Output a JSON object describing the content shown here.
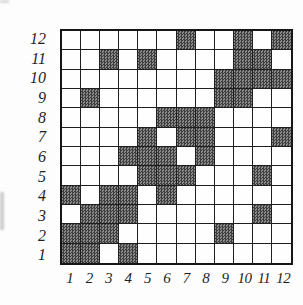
{
  "figure": {
    "kind": "binary matrix grid figure",
    "row_labels_top_to_bottom": [
      "12",
      "11",
      "10",
      "9",
      "8",
      "7",
      "6",
      "5",
      "4",
      "3",
      "2",
      "1"
    ],
    "col_labels_left_to_right": [
      "1",
      "2",
      "3",
      "4",
      "5",
      "6",
      "7",
      "8",
      "9",
      "10",
      "11",
      "12"
    ]
  },
  "chart_data": {
    "type": "heatmap",
    "title": "",
    "xlabel": "",
    "ylabel": "",
    "x_tick_labels": [
      "1",
      "2",
      "3",
      "4",
      "5",
      "6",
      "7",
      "8",
      "9",
      "10",
      "11",
      "12"
    ],
    "y_tick_labels_top_to_bottom": [
      "12",
      "11",
      "10",
      "9",
      "8",
      "7",
      "6",
      "5",
      "4",
      "3",
      "2",
      "1"
    ],
    "legend": "none",
    "grid": true,
    "matrix_rows_top_to_bottom": [
      [
        0,
        0,
        0,
        0,
        0,
        0,
        1,
        0,
        0,
        1,
        0,
        1
      ],
      [
        0,
        0,
        1,
        0,
        1,
        0,
        0,
        0,
        0,
        1,
        1,
        0
      ],
      [
        0,
        0,
        0,
        0,
        0,
        0,
        0,
        0,
        1,
        1,
        1,
        1
      ],
      [
        0,
        1,
        0,
        0,
        0,
        0,
        0,
        0,
        1,
        1,
        0,
        0
      ],
      [
        0,
        0,
        0,
        0,
        0,
        1,
        1,
        1,
        0,
        0,
        0,
        0
      ],
      [
        0,
        0,
        0,
        0,
        1,
        0,
        1,
        1,
        0,
        0,
        0,
        1
      ],
      [
        0,
        0,
        0,
        1,
        1,
        1,
        0,
        1,
        0,
        0,
        0,
        0
      ],
      [
        0,
        0,
        0,
        0,
        1,
        1,
        1,
        0,
        0,
        0,
        1,
        0
      ],
      [
        1,
        0,
        1,
        1,
        0,
        1,
        0,
        0,
        0,
        0,
        0,
        0
      ],
      [
        0,
        1,
        1,
        1,
        0,
        0,
        0,
        0,
        0,
        0,
        1,
        0
      ],
      [
        1,
        1,
        1,
        0,
        0,
        0,
        0,
        0,
        1,
        0,
        0,
        0
      ],
      [
        1,
        1,
        0,
        1,
        0,
        0,
        0,
        0,
        0,
        0,
        0,
        0
      ]
    ],
    "shaded_cells_by_row": {
      "12": [
        7,
        10,
        12
      ],
      "11": [
        3,
        5,
        10,
        11
      ],
      "10": [
        9,
        10,
        11,
        12
      ],
      "9": [
        2,
        9,
        10
      ],
      "8": [
        6,
        7,
        8
      ],
      "7": [
        5,
        7,
        8,
        12
      ],
      "6": [
        4,
        5,
        6,
        8
      ],
      "5": [
        5,
        6,
        7,
        11
      ],
      "4": [
        1,
        3,
        4,
        6
      ],
      "3": [
        2,
        3,
        4,
        11
      ],
      "2": [
        1,
        2,
        3,
        9
      ],
      "1": [
        1,
        2,
        4
      ]
    },
    "colors": {
      "shaded_pattern_dark": "#3e3e3e",
      "shaded_pattern_light": "#8a8a8a",
      "grid_line": "#1f1f1f",
      "outer_border": "#161616",
      "background": "#fdfdfd",
      "label_color": "#1f1f1f"
    }
  }
}
